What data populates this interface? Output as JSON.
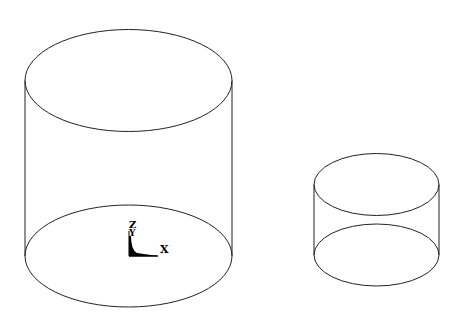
{
  "diagram": {
    "stroke_color": "#222222",
    "background": "#ffffff",
    "objects": [
      {
        "name": "large-cylinder",
        "cx": 128.5,
        "top_cy": 80.5,
        "bottom_cy": 256,
        "rx": 103.5,
        "ry": 51
      },
      {
        "name": "small-cylinder",
        "cx": 376.5,
        "top_cy": 184.5,
        "bottom_cy": 255,
        "rx": 62.5,
        "ry": 31
      }
    ],
    "axis_triad": {
      "labels": {
        "z": "Z",
        "y": "Y",
        "x": "X"
      }
    }
  }
}
